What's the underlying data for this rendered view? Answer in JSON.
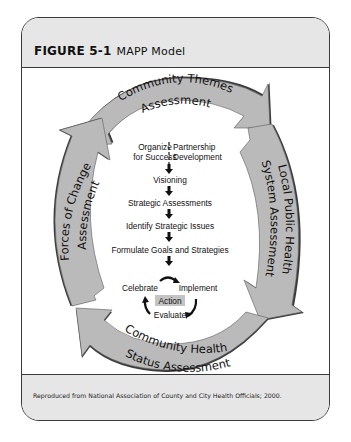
{
  "figure": {
    "label": "FIGURE 5-1",
    "title": "MAPP Model",
    "credit": "Reproduced from National Association of County and City Health Officials; 2000."
  },
  "assessments": {
    "top": [
      "Community Themes",
      "Assessment"
    ],
    "right": [
      "Local Public Health",
      "System Assessment"
    ],
    "bottom": [
      "Community Health",
      "Status Assessment"
    ],
    "left": [
      "Forces of Change",
      "Assessment"
    ]
  },
  "steps": {
    "organize": [
      "Organize",
      "for Success"
    ],
    "partnership": [
      "Partnership",
      "Development"
    ],
    "visioning": "Visioning",
    "strategic_assessments": "Strategic Assessments",
    "identify_issues": "Identify Strategic Issues",
    "formulate": "Formulate Goals and Strategies"
  },
  "action_cycle": {
    "celebrate": "Celebrate",
    "implement": "Implement",
    "action": "Action",
    "evaluate": "Evaluate"
  },
  "colors": {
    "arrow_fill": "#b9b9b9",
    "arrow_shadow": "#3c3c3c",
    "header_bg": "#e6e6e6",
    "action_bg": "#c4c4c4"
  }
}
